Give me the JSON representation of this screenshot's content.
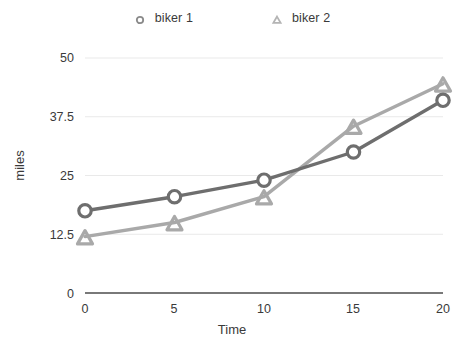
{
  "chart_data": {
    "type": "line",
    "title": "",
    "xlabel": "Time",
    "ylabel": "miles",
    "x": [
      0,
      5,
      10,
      15,
      20
    ],
    "xticklabels": [
      "0",
      "5",
      "10",
      "15",
      "20"
    ],
    "yticks": [
      0,
      12.5,
      25,
      37.5,
      50
    ],
    "yticklabels": [
      "0",
      "12.5",
      "25",
      "37.5",
      "50"
    ],
    "xlim": [
      0,
      20
    ],
    "ylim": [
      0,
      50
    ],
    "grid": true,
    "legend_position": "top-center",
    "series": [
      {
        "name": "biker 1",
        "marker": "circle",
        "color": "#6e6e6e",
        "values": [
          17.5,
          20.5,
          24,
          30,
          41
        ]
      },
      {
        "name": "biker 2",
        "marker": "triangle",
        "color": "#a9a9a9",
        "values": [
          12,
          15,
          20.5,
          35.5,
          44.5
        ]
      }
    ]
  },
  "legend": {
    "items": [
      {
        "label": "biker 1",
        "marker": "circle-marker-icon",
        "color": "#6e6e6e"
      },
      {
        "label": "biker 2",
        "marker": "triangle-marker-icon",
        "color": "#a9a9a9"
      }
    ]
  },
  "axes": {
    "x_title": "Time",
    "y_title": "miles",
    "x_ticks": [
      "0",
      "5",
      "10",
      "15",
      "20"
    ],
    "y_ticks": [
      "50",
      "37.5",
      "25",
      "12.5",
      "0"
    ]
  },
  "colors": {
    "series1": "#6e6e6e",
    "series2": "#a9a9a9",
    "axis": "#4d4d4d",
    "grid": "#e9e9e9",
    "text": "#3a3a3a",
    "background": "#ffffff"
  }
}
